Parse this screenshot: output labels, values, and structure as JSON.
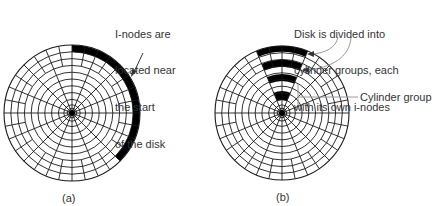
{
  "figure_a": {
    "caption": "(a)",
    "annotation": [
      "I-nodes are",
      "located near",
      "the start",
      "of the disk"
    ],
    "disk": {
      "cx": 72,
      "cy": 113,
      "r": 68
    },
    "inode_band": {
      "inner_r": 61,
      "outer_r": 68,
      "start_deg": 0,
      "end_deg": 135
    }
  },
  "figure_b": {
    "caption": "(b)",
    "annotation": [
      "Disk is divided into",
      "cylinder groups, each",
      "with its own i-nodes"
    ],
    "cylinder_group_label": "Cylinder group",
    "disk": {
      "cx": 282,
      "cy": 113,
      "r": 67
    },
    "inode_sector": {
      "start_deg": -22.5,
      "end_deg": 22.5,
      "bands": [
        [
          61,
          67
        ],
        [
          46,
          53
        ],
        [
          32,
          39
        ],
        [
          13,
          22
        ]
      ]
    }
  },
  "style": {
    "line_color": "#1a1a1a",
    "fill_color": "#000000",
    "callout_color": "#9a9a9a",
    "text_color": "#333333"
  },
  "rings_radii_fraction": [
    1.0,
    0.9,
    0.8,
    0.7,
    0.6,
    0.5,
    0.4,
    0.3,
    0.2,
    0.12,
    0.07
  ],
  "spokes_inner": 16,
  "spokes_outer": 32
}
